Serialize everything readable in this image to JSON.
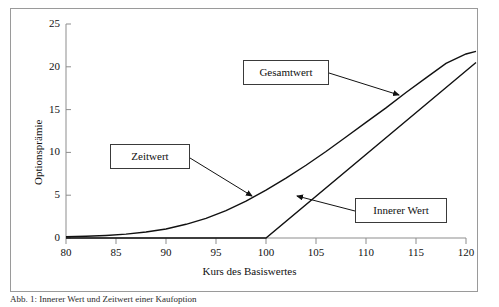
{
  "figure": {
    "caption": "Abb. 1: Innerer Wert und Zeitwert einer Kaufoption"
  },
  "chart_data": {
    "type": "line",
    "title": "",
    "xlabel": "Kurs des Basiswertes",
    "ylabel": "Optionsprämie",
    "xlim": [
      80,
      120
    ],
    "ylim": [
      0,
      25
    ],
    "xticks": [
      80,
      85,
      90,
      95,
      100,
      105,
      110,
      115,
      120
    ],
    "yticks": [
      0,
      5,
      10,
      15,
      20,
      25
    ],
    "grid": false,
    "legend_position": "annotations",
    "strike": 100,
    "annotations": [
      {
        "label": "Gesamtwert",
        "points_to_x": 113.5,
        "points_to_y": 15.2
      },
      {
        "label": "Zeitwert",
        "points_to_x": 98.5,
        "points_to_y": 3.2
      },
      {
        "label": "Innerer Wert",
        "points_to_x": 102.8,
        "points_to_y": 2.8
      }
    ],
    "series": [
      {
        "name": "Gesamtwert",
        "x": [
          80,
          82,
          84,
          86,
          88,
          90,
          92,
          94,
          96,
          98,
          100,
          102,
          104,
          106,
          108,
          110,
          112,
          114,
          116,
          118,
          120,
          121
        ],
        "values": [
          0.15,
          0.2,
          0.3,
          0.45,
          0.7,
          1.05,
          1.6,
          2.3,
          3.2,
          4.3,
          5.6,
          7.0,
          8.5,
          10.1,
          11.8,
          13.5,
          15.2,
          17.0,
          18.7,
          20.4,
          21.5,
          21.8
        ]
      },
      {
        "name": "Innerer Wert",
        "x": [
          80,
          100,
          121
        ],
        "values": [
          0,
          0,
          20.5
        ]
      }
    ]
  },
  "axis": {
    "x_tick_labels": [
      "80",
      "85",
      "90",
      "95",
      "100",
      "105",
      "110",
      "115",
      "120"
    ],
    "y_tick_labels": [
      "0",
      "5",
      "10",
      "15",
      "20",
      "25"
    ]
  }
}
